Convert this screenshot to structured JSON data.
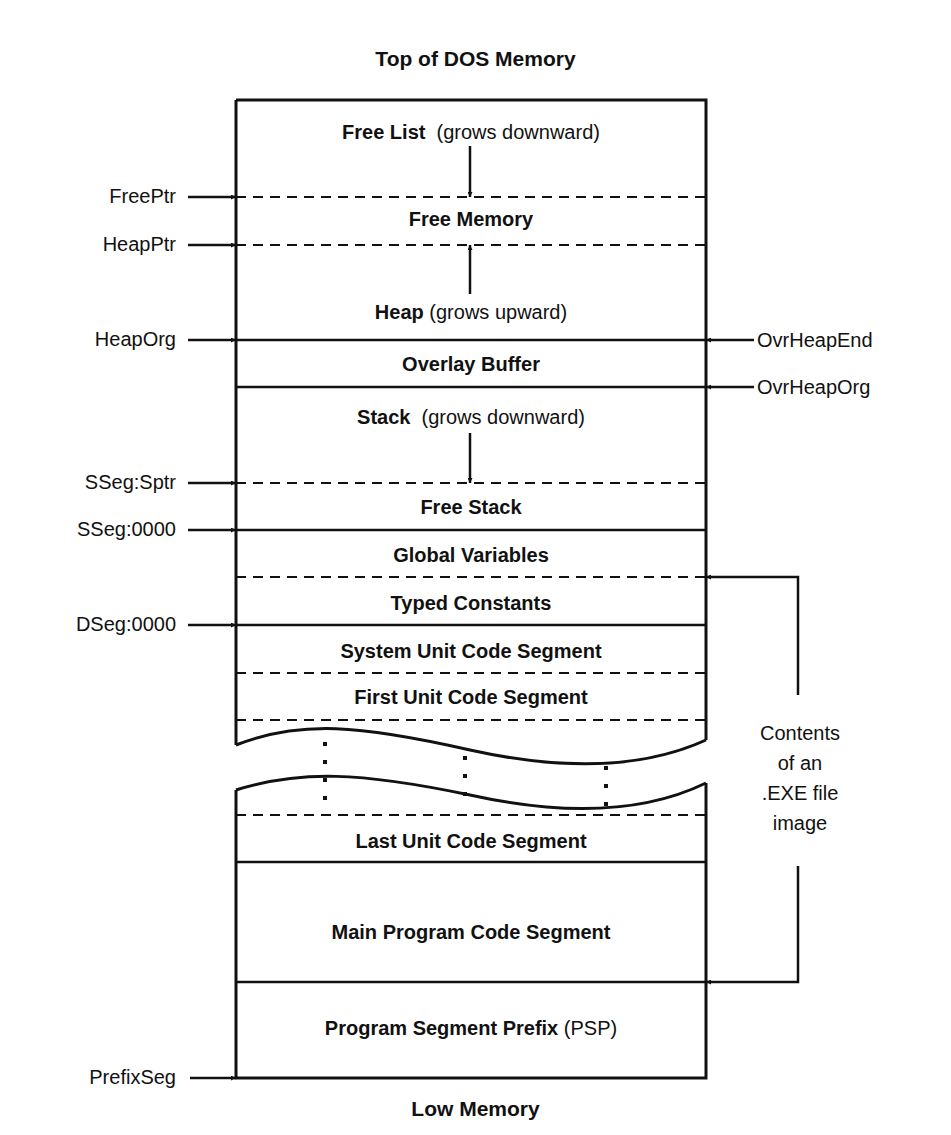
{
  "diagram": {
    "title_top": "Top of DOS Memory",
    "title_bottom": "Low Memory",
    "segments": [
      {
        "name": "Free List",
        "note": "(grows downward)",
        "style_above": "solid"
      },
      {
        "name": "Free  Memory",
        "note": "",
        "style_above": "dashed"
      },
      {
        "name": "Heap",
        "note": "(grows upward)",
        "style_above": "dashed"
      },
      {
        "name": "Overlay Buffer",
        "note": "",
        "style_above": "solid"
      },
      {
        "name": "Stack",
        "note": "(grows downward)",
        "style_above": "solid"
      },
      {
        "name": "Free  Stack",
        "note": "",
        "style_above": "dashed"
      },
      {
        "name": "Global Variables",
        "note": "",
        "style_above": "solid"
      },
      {
        "name": "Typed Constants",
        "note": "",
        "style_above": "dashed"
      },
      {
        "name": "System Unit Code Segment",
        "note": "",
        "style_above": "solid"
      },
      {
        "name": "First Unit Code Segment",
        "note": "",
        "style_above": "dashed"
      },
      {
        "name": "Last Unit Code Segment",
        "note": "",
        "style_above": "dashed"
      },
      {
        "name": "Main Program Code Segment",
        "note": "",
        "style_above": "solid"
      },
      {
        "name": "Program Segment Prefix",
        "note": "(PSP)",
        "style_above": "solid"
      }
    ],
    "left_pointers": [
      {
        "label": "FreePtr"
      },
      {
        "label": "HeapPtr"
      },
      {
        "label": "HeapOrg"
      },
      {
        "label": "SSeg:Sptr"
      },
      {
        "label": "SSeg:0000"
      },
      {
        "label": "DSeg:0000"
      },
      {
        "label": "PrefixSeg"
      }
    ],
    "right_pointers": [
      {
        "label": "OvrHeapEnd"
      },
      {
        "label": "OvrHeapOrg"
      }
    ],
    "exe_bracket": {
      "lines": [
        "Contents",
        "of an",
        ".EXE file",
        "image"
      ]
    },
    "colors": {
      "ink": "#111111",
      "background": "#ffffff"
    }
  }
}
